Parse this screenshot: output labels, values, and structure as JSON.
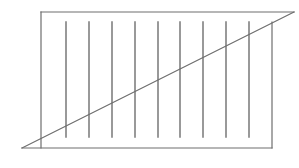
{
  "diagram": {
    "stroke_color": "#6e6e6e",
    "frame": {
      "top": {
        "x1": 41,
        "y1": 12,
        "x2": 294,
        "y2": 12
      },
      "left": {
        "x1": 41,
        "y1": 12,
        "x2": 41,
        "y2": 148
      },
      "bottom": {
        "x1": 22,
        "y1": 148,
        "x2": 272,
        "y2": 148
      },
      "right": {
        "x1": 272,
        "y1": 22,
        "x2": 272,
        "y2": 148
      }
    },
    "diagonal": {
      "x1": 22,
      "y1": 148,
      "x2": 294,
      "y2": 12
    },
    "vertical_lines": {
      "y_top": 22,
      "y_bottom": 137,
      "x_positions": [
        66,
        89,
        112,
        135,
        158,
        180,
        203,
        226,
        249
      ]
    }
  }
}
